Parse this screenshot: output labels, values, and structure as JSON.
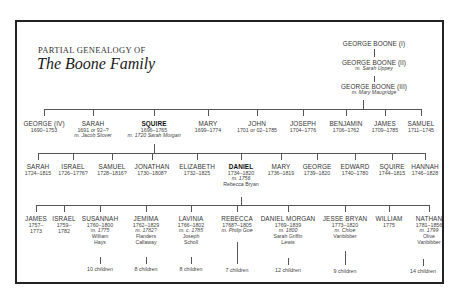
{
  "title": {
    "subtitle": "PARTIAL GENEALOGY OF",
    "main": "The Boone Family"
  },
  "ancestors": [
    {
      "name": "GEORGE BOONE (I)",
      "spouse": ""
    },
    {
      "name": "GEORGE BOONE (II)",
      "spouse": "m. Sarah Uppey"
    },
    {
      "name": "GEORGE BOONE (III)",
      "spouse": "m. Mary Maugridge"
    }
  ],
  "generation1": [
    {
      "name": "GEORGE (IV)",
      "dates": "1690–1753",
      "spouse": ""
    },
    {
      "name": "SARAH",
      "dates": "1691 or 92–?",
      "spouse": "m. Jacob Stover"
    },
    {
      "name": "SQUIRE",
      "dates": "1696–1765",
      "spouse": "m. 1720 Sarah Morgan",
      "bold": true
    },
    {
      "name": "MARY",
      "dates": "1699–1774",
      "spouse": ""
    },
    {
      "name": "JOHN",
      "dates": "1701 or 02–1785",
      "spouse": ""
    },
    {
      "name": "JOSEPH",
      "dates": "1704–1776",
      "spouse": ""
    },
    {
      "name": "BENJAMIN",
      "dates": "1706–1762",
      "spouse": ""
    },
    {
      "name": "JAMES",
      "dates": "1709–1785",
      "spouse": ""
    },
    {
      "name": "SAMUEL",
      "dates": "1711–1745",
      "spouse": ""
    }
  ],
  "generation2": [
    {
      "name": "SARAH",
      "dates": "1724–1815"
    },
    {
      "name": "ISRAEL",
      "dates": "1726–1776?"
    },
    {
      "name": "SAMUEL",
      "dates": "1728–1816?"
    },
    {
      "name": "JONATHAN",
      "dates": "1730–1808?"
    },
    {
      "name": "ELIZABETH",
      "dates": "1732–1825"
    },
    {
      "name": "DANIEL",
      "dates": "1734–1820",
      "spouse_line1": "m. 1756",
      "spouse_line2": "Rebecca Bryan",
      "bold": true
    },
    {
      "name": "MARY",
      "dates": "1736–1819"
    },
    {
      "name": "GEORGE",
      "dates": "1739–1820"
    },
    {
      "name": "EDWARD",
      "dates": "1740–1780"
    },
    {
      "name": "SQUIRE",
      "dates": "1744–1815"
    },
    {
      "name": "HANNAH",
      "dates": "1746–1828"
    }
  ],
  "generation3": [
    {
      "name": "JAMES",
      "dates_line1": "1757–",
      "dates_line2": "1773",
      "spouse_line1": "",
      "spouse_line2": "",
      "spouse_line3": "",
      "children": ""
    },
    {
      "name": "ISRAEL",
      "dates_line1": "1759–",
      "dates_line2": "1782",
      "spouse_line1": "",
      "spouse_line2": "",
      "spouse_line3": "",
      "children": ""
    },
    {
      "name": "SUSANNAH",
      "dates_line1": "1760–1800",
      "dates_line2": "",
      "spouse_line1": "m. 1775",
      "spouse_line2": "William",
      "spouse_line3": "Hays",
      "children": "10 children"
    },
    {
      "name": "JEMIMA",
      "dates_line1": "1762–1829",
      "dates_line2": "",
      "spouse_line1": "m. 1782?",
      "spouse_line2": "Flanders",
      "spouse_line3": "Callaway",
      "children": "8 children"
    },
    {
      "name": "LAVINIA",
      "dates_line1": "1766–1802",
      "dates_line2": "",
      "spouse_line1": "m. c. 1785",
      "spouse_line2": "Joseph",
      "spouse_line3": "Scholl",
      "children": "8 children"
    },
    {
      "name": "REBECCA",
      "dates_line1": "1768?–1805",
      "dates_line2": "",
      "spouse_line1": "m. Philip Goe",
      "spouse_line2": "",
      "spouse_line3": "",
      "children": "7 children"
    },
    {
      "name": "DANIEL MORGAN",
      "dates_line1": "1769–1839",
      "dates_line2": "",
      "spouse_line1": "m. 1800",
      "spouse_line2": "Sarah Griffin",
      "spouse_line3": "Lewis",
      "children": "12 children"
    },
    {
      "name": "JESSE BRYAN",
      "dates_line1": "1773–1820",
      "dates_line2": "",
      "spouse_line1": "m. Chloe",
      "spouse_line2": "Vanbibber",
      "spouse_line3": "",
      "children": "9 children"
    },
    {
      "name": "WILLIAM",
      "dates_line1": "1775",
      "dates_line2": "",
      "spouse_line1": "",
      "spouse_line2": "",
      "spouse_line3": "",
      "children": ""
    },
    {
      "name": "NATHAN",
      "dates_line1": "1781–1856",
      "dates_line2": "",
      "spouse_line1": "m. 1799",
      "spouse_line2": "Olive",
      "spouse_line3": "Vanbibber",
      "children": "14 children"
    }
  ],
  "colors": {
    "frame": "#222222",
    "lines": "#555555",
    "text": "#333333"
  }
}
